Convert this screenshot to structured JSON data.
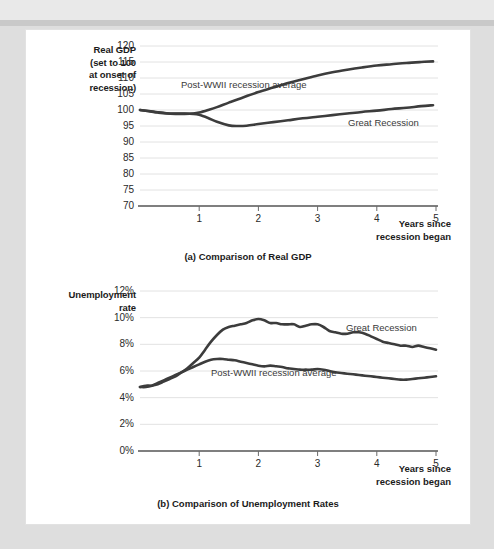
{
  "figure": {
    "panels": [
      {
        "id": "gdp",
        "caption": "(a) Comparison of Real GDP",
        "y_axis_title_lines": [
          "Real GDP",
          "(set to 100",
          "at onset of",
          "recession)"
        ],
        "x_axis_label_lines": [
          "Years since",
          "recession began"
        ],
        "series_labels": {
          "postwwii": "Post-WWII recession average",
          "great": "Great Recession"
        }
      },
      {
        "id": "unemployment",
        "caption": "(b) Comparison of Unemployment Rates",
        "y_axis_title_lines": [
          "Unemployment",
          "rate"
        ],
        "x_axis_label_lines": [
          "Years since",
          "recession began"
        ],
        "series_labels": {
          "great": "Great Recession",
          "postwwii": "Post-WWII recession average"
        }
      }
    ],
    "colors": {
      "line": "#3c3c3c",
      "grid": "#e2e2e2",
      "axis": "#555555",
      "text": "#1b1b1b",
      "page": "#ffffff",
      "background": "#dedede"
    }
  },
  "chart_data": [
    {
      "type": "line",
      "title": "(a) Comparison of Real GDP",
      "xlabel": "Years since recession began",
      "ylabel": "Real GDP (set to 100 at onset of recession)",
      "xlim": [
        0,
        5
      ],
      "ylim": [
        70,
        120
      ],
      "xticks": [
        1,
        2,
        3,
        4,
        5
      ],
      "yticks": [
        70,
        75,
        80,
        85,
        90,
        95,
        100,
        105,
        110,
        115,
        120
      ],
      "ytick_labels": [
        "70",
        "75",
        "80",
        "85",
        "90",
        "95",
        "100",
        "105",
        "110",
        "115",
        "120"
      ],
      "grid": true,
      "legend": "inline-annotations",
      "series": [
        {
          "name": "Post-WWII recession average",
          "x": [
            0.0,
            0.15,
            0.3,
            0.45,
            0.6,
            0.75,
            0.9,
            1.0,
            1.15,
            1.3,
            1.5,
            1.75,
            2.0,
            2.25,
            2.5,
            2.75,
            3.0,
            3.25,
            3.5,
            3.75,
            4.0,
            4.25,
            4.5,
            4.75,
            4.95
          ],
          "y": [
            100.0,
            99.6,
            99.2,
            98.9,
            98.8,
            98.8,
            98.9,
            99.2,
            100.0,
            100.9,
            102.3,
            104.0,
            105.6,
            107.0,
            108.4,
            109.6,
            110.8,
            111.8,
            112.6,
            113.3,
            113.9,
            114.3,
            114.7,
            115.0,
            115.2
          ]
        },
        {
          "name": "Great Recession",
          "x": [
            0.0,
            0.15,
            0.3,
            0.45,
            0.6,
            0.75,
            0.9,
            1.0,
            1.15,
            1.3,
            1.5,
            1.65,
            1.8,
            2.0,
            2.25,
            2.5,
            2.75,
            3.0,
            3.25,
            3.5,
            3.75,
            4.0,
            4.25,
            4.5,
            4.75,
            4.95
          ],
          "y": [
            100.0,
            99.7,
            99.3,
            99.0,
            98.9,
            98.9,
            98.8,
            98.5,
            97.5,
            96.3,
            95.2,
            95.0,
            95.1,
            95.6,
            96.2,
            96.8,
            97.4,
            97.9,
            98.4,
            98.9,
            99.4,
            99.8,
            100.3,
            100.7,
            101.2,
            101.5
          ]
        }
      ]
    },
    {
      "type": "line",
      "title": "(b) Comparison of Unemployment Rates",
      "xlabel": "Years since recession began",
      "ylabel": "Unemployment rate",
      "xlim": [
        0,
        5
      ],
      "ylim": [
        0,
        12
      ],
      "xticks": [
        1,
        2,
        3,
        4,
        5
      ],
      "yticks": [
        0,
        2,
        4,
        6,
        8,
        10,
        12
      ],
      "ytick_labels": [
        "0%",
        "2%",
        "4%",
        "6%",
        "8%",
        "10%",
        "12%"
      ],
      "grid": true,
      "legend": "inline-annotations",
      "series": [
        {
          "name": "Great Recession",
          "x": [
            0.0,
            0.1,
            0.2,
            0.3,
            0.4,
            0.5,
            0.6,
            0.7,
            0.8,
            0.9,
            1.0,
            1.1,
            1.2,
            1.3,
            1.4,
            1.5,
            1.6,
            1.7,
            1.8,
            1.9,
            2.0,
            2.1,
            2.2,
            2.3,
            2.4,
            2.5,
            2.6,
            2.7,
            2.8,
            2.9,
            3.0,
            3.1,
            3.2,
            3.3,
            3.4,
            3.5,
            3.6,
            3.7,
            3.8,
            3.9,
            4.0,
            4.1,
            4.2,
            4.3,
            4.4,
            4.5,
            4.6,
            4.7,
            4.8,
            4.9,
            5.0
          ],
          "y": [
            4.8,
            4.9,
            4.9,
            5.0,
            5.2,
            5.4,
            5.6,
            5.9,
            6.2,
            6.6,
            7.0,
            7.6,
            8.2,
            8.7,
            9.1,
            9.3,
            9.4,
            9.5,
            9.6,
            9.8,
            9.9,
            9.8,
            9.6,
            9.6,
            9.5,
            9.5,
            9.5,
            9.3,
            9.4,
            9.5,
            9.5,
            9.3,
            9.0,
            8.9,
            8.8,
            8.8,
            8.9,
            8.9,
            8.8,
            8.6,
            8.4,
            8.2,
            8.1,
            8.0,
            7.9,
            7.9,
            7.8,
            7.9,
            7.8,
            7.7,
            7.6
          ]
        },
        {
          "name": "Post-WWII recession average",
          "x": [
            0.0,
            0.1,
            0.2,
            0.3,
            0.4,
            0.5,
            0.6,
            0.7,
            0.8,
            0.9,
            1.0,
            1.1,
            1.2,
            1.3,
            1.4,
            1.5,
            1.6,
            1.7,
            1.8,
            1.9,
            2.0,
            2.1,
            2.2,
            2.3,
            2.4,
            2.5,
            2.6,
            2.7,
            2.8,
            2.9,
            3.0,
            3.1,
            3.2,
            3.3,
            3.4,
            3.5,
            3.6,
            3.7,
            3.8,
            3.9,
            4.0,
            4.1,
            4.2,
            4.3,
            4.4,
            4.5,
            4.6,
            4.7,
            4.8,
            4.9,
            5.0
          ],
          "y": [
            4.8,
            4.8,
            4.9,
            5.1,
            5.3,
            5.5,
            5.7,
            5.9,
            6.1,
            6.3,
            6.5,
            6.7,
            6.85,
            6.9,
            6.9,
            6.85,
            6.8,
            6.7,
            6.6,
            6.5,
            6.4,
            6.35,
            6.4,
            6.35,
            6.3,
            6.2,
            6.15,
            6.1,
            6.1,
            6.1,
            6.15,
            6.1,
            6.0,
            5.9,
            5.85,
            5.8,
            5.75,
            5.7,
            5.65,
            5.6,
            5.55,
            5.5,
            5.45,
            5.4,
            5.35,
            5.35,
            5.4,
            5.45,
            5.5,
            5.55,
            5.6
          ]
        }
      ]
    }
  ]
}
